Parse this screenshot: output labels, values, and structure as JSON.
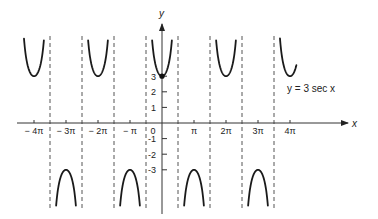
{
  "chart_data": {
    "type": "line",
    "title": "",
    "function": "y = 3 sec x",
    "equation_label": "y = 3 sec x",
    "xlabel": "x",
    "ylabel": "y",
    "x_unit": "pi",
    "xlim_pi": [
      -4.5,
      5.8
    ],
    "ylim": [
      -5.9,
      6.5
    ],
    "x_ticks": [
      {
        "value_pi": -4,
        "label": "− 4π"
      },
      {
        "value_pi": -3,
        "label": "− 3π"
      },
      {
        "value_pi": -2,
        "label": "− 2π"
      },
      {
        "value_pi": -1,
        "label": "− π"
      },
      {
        "value_pi": 0,
        "label": "0"
      },
      {
        "value_pi": 1,
        "label": "π"
      },
      {
        "value_pi": 2,
        "label": "2π"
      },
      {
        "value_pi": 3,
        "label": "3π"
      },
      {
        "value_pi": 4,
        "label": "4π"
      }
    ],
    "y_ticks": [
      {
        "value": 3,
        "label": "3"
      },
      {
        "value": 2,
        "label": "2"
      },
      {
        "value": 1,
        "label": "1"
      },
      {
        "value": -1,
        "label": "1"
      },
      {
        "value": -2,
        "label": "2"
      },
      {
        "value": -3,
        "label": "3"
      }
    ],
    "asymptotes_pi": [
      -3.5,
      -2.5,
      -1.5,
      -0.5,
      0.5,
      1.5,
      2.5,
      3.5
    ],
    "branches": [
      {
        "from_pi": -4.42,
        "to_pi": -3.5,
        "sign": 1
      },
      {
        "from_pi": -3.5,
        "to_pi": -2.5,
        "sign": -1
      },
      {
        "from_pi": -2.5,
        "to_pi": -1.5,
        "sign": 1
      },
      {
        "from_pi": -1.5,
        "to_pi": -0.5,
        "sign": -1
      },
      {
        "from_pi": -0.5,
        "to_pi": 0.5,
        "sign": 1
      },
      {
        "from_pi": 0.5,
        "to_pi": 1.5,
        "sign": -1
      },
      {
        "from_pi": 1.5,
        "to_pi": 2.5,
        "sign": 1
      },
      {
        "from_pi": 2.5,
        "to_pi": 3.5,
        "sign": -1
      },
      {
        "from_pi": 3.5,
        "to_pi": 4.2,
        "sign": 1
      }
    ],
    "marked_point": {
      "x": 0,
      "y": 3
    },
    "grid": false,
    "colors": {
      "curve": "#1a1a1a",
      "axis": "#333333",
      "asymptote": "#555555"
    }
  }
}
